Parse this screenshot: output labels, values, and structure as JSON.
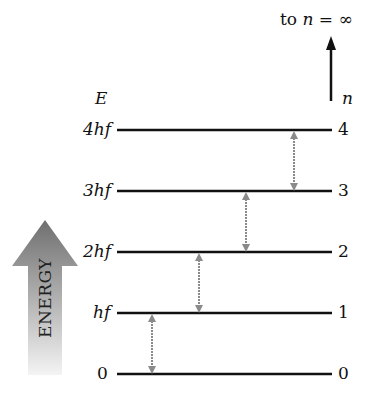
{
  "title_top": "to n = ∞",
  "top_label_prefix": "to ",
  "top_label_var": "n",
  "top_label_suffix": " = ∞",
  "energy_axis_label": "E",
  "n_axis_label": "n",
  "energy_arrow_text": "ENERGY",
  "levels": [
    {
      "n": "4",
      "energy": "4hf",
      "y": 130
    },
    {
      "n": "3",
      "energy": "3hf",
      "y": 191
    },
    {
      "n": "2",
      "energy": "2hf",
      "y": 252
    },
    {
      "n": "1",
      "energy": "hf",
      "y": 313
    },
    {
      "n": "0",
      "energy": "0",
      "y": 374
    }
  ],
  "transitions": [
    {
      "from": "0",
      "to": "1",
      "x": 152
    },
    {
      "from": "1",
      "to": "2",
      "x": 199
    },
    {
      "from": "2",
      "to": "3",
      "x": 246
    },
    {
      "from": "3",
      "to": "4",
      "x": 294
    }
  ],
  "colors": {
    "line": "#111111",
    "transition": "#8a8a8a",
    "energy_arrow": "#7a7a7a"
  }
}
